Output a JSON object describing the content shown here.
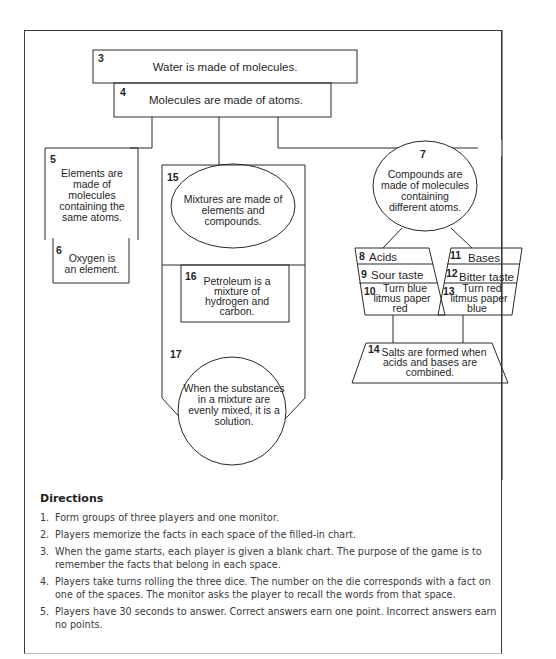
{
  "diagram": {
    "boxes": [
      {
        "id": "3",
        "text": "Water is made of molecules."
      },
      {
        "id": "4",
        "text": "Molecules are made of atoms."
      },
      {
        "id": "5",
        "lines": [
          "Elements are",
          "made of",
          "molecules",
          "containing the",
          "same atoms."
        ]
      },
      {
        "id": "6",
        "lines": [
          "Oxygen is",
          "an element."
        ]
      },
      {
        "id": "7",
        "lines": [
          "Compounds are",
          "made of molecules",
          "containing",
          "different atoms."
        ]
      },
      {
        "id": "8",
        "text": "Acids"
      },
      {
        "id": "9",
        "text": "Sour taste"
      },
      {
        "id": "10",
        "lines": [
          "Turn blue",
          "litmus paper",
          "red"
        ]
      },
      {
        "id": "11",
        "text": "Bases"
      },
      {
        "id": "12",
        "text": "Bitter taste"
      },
      {
        "id": "13",
        "lines": [
          "Turn red",
          "litmus paper",
          "blue"
        ]
      },
      {
        "id": "14",
        "lines": [
          "Salts are formed when",
          "acids and bases are",
          "combined."
        ]
      },
      {
        "id": "15",
        "lines": [
          "Mixtures are made of",
          "elements and",
          "compounds."
        ]
      },
      {
        "id": "16",
        "lines": [
          "Petroleum is a",
          "mixture of",
          "hydrogen and",
          "carbon."
        ]
      },
      {
        "id": "17",
        "lines": [
          "When the substances",
          "in a mixture are",
          "evenly mixed, it is a",
          "solution."
        ]
      }
    ]
  },
  "directions": {
    "heading": "Directions",
    "items": [
      {
        "n": "1.",
        "text": "Form groups of three players and one monitor."
      },
      {
        "n": "2.",
        "text": "Players memorize the facts in each space of the filled-in chart."
      },
      {
        "n": "3.",
        "text": "When the game starts, each player is given a blank chart. The purpose of the game is to remember the facts that belong in each space."
      },
      {
        "n": "4.",
        "text": "Players take turns rolling the three dice. The number on the die corresponds with a fact on one of the spaces. The monitor asks the player to recall the words from that space."
      },
      {
        "n": "5.",
        "text": "Players have 30 seconds to answer. Correct answers earn one point. Incorrect answers earn no points."
      }
    ]
  }
}
